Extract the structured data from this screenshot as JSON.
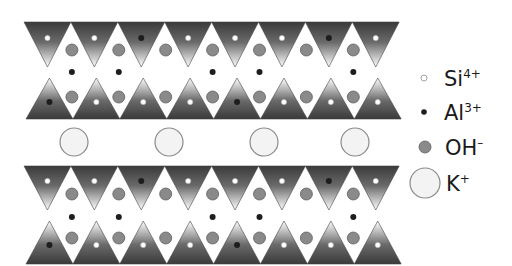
{
  "diagram": {
    "colors": {
      "tetra_dark": "#3a3a3a",
      "tetra_light": "#ffffff",
      "si_fill": "#ffffff",
      "al_fill": "#1e1e1e",
      "oh_fill": "#8a8a8a",
      "oh_stroke": "#5e5e5e",
      "k_fill": "#f3f3f3",
      "k_stroke": "#8a8a8a"
    },
    "layout": {
      "x_start": 24,
      "period": 46.9,
      "count": 8
    },
    "layers": [
      {
        "name": "upper-sheet",
        "top_row": {
          "base_y": 22,
          "apex_y": 67,
          "dot_y": 38,
          "dots": [
            "Si",
            "Si",
            "Al",
            "Si",
            "Si",
            "Si",
            "Al",
            "Si"
          ]
        },
        "oh_top_y": 50,
        "middle_al_y": 72,
        "middle_al_gaps": [
          0,
          1,
          3,
          4,
          6
        ],
        "oh_bottom_y": 97,
        "bottom_row": {
          "base_y": 119,
          "apex_y": 78,
          "dot_y": 102,
          "dots": [
            "Al",
            "Si",
            "Si",
            "Si",
            "Al",
            "Si",
            "Si",
            "Si"
          ]
        }
      },
      {
        "name": "lower-sheet",
        "top_row": {
          "base_y": 166,
          "apex_y": 210,
          "dot_y": 181,
          "dots": [
            "Si",
            "Si",
            "Al",
            "Si",
            "Si",
            "Si",
            "Al",
            "Si"
          ]
        },
        "oh_top_y": 194,
        "middle_al_y": 217,
        "middle_al_gaps": [
          0,
          1,
          3,
          4,
          6
        ],
        "oh_bottom_y": 238,
        "bottom_row": {
          "base_y": 264,
          "apex_y": 221,
          "dot_y": 245,
          "dots": [
            "Al",
            "Si",
            "Si",
            "Si",
            "Al",
            "Si",
            "Si",
            "Si"
          ]
        }
      }
    ],
    "interlayer_k": {
      "y": 142,
      "r": 14,
      "x": [
        74,
        169,
        264,
        355
      ]
    }
  },
  "legend": {
    "items": [
      {
        "id": "si",
        "symbol": "Si",
        "charge": "4+",
        "marker": "small-open-dot",
        "cx": 424,
        "cy": 78,
        "r": 3,
        "text_x": 444,
        "text_y": 86
      },
      {
        "id": "al",
        "symbol": "Al",
        "charge": "3+",
        "marker": "small-filled-dot",
        "cx": 424,
        "cy": 112,
        "r": 2.8,
        "text_x": 444,
        "text_y": 120
      },
      {
        "id": "oh",
        "symbol": "OH",
        "charge": "–",
        "marker": "gray-dot",
        "cx": 425,
        "cy": 147,
        "r": 6,
        "text_x": 445,
        "text_y": 155
      },
      {
        "id": "k",
        "symbol": "K",
        "charge": "+",
        "marker": "large-open-circle",
        "cx": 425,
        "cy": 183,
        "r": 15,
        "text_x": 446,
        "text_y": 191
      }
    ]
  }
}
